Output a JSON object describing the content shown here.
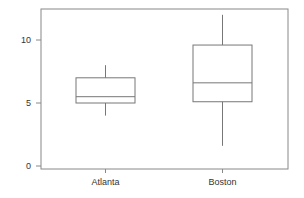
{
  "chart_data": {
    "type": "box",
    "title": "",
    "xlabel": "",
    "ylabel": "",
    "ylim": [
      -0.2,
      12.5
    ],
    "yticks": [
      0,
      5,
      10
    ],
    "ytick_labels": [
      "0",
      "5",
      "10"
    ],
    "categories": [
      "Atlanta",
      "Boston"
    ],
    "series": [
      {
        "name": "Atlanta",
        "whisker_low": 4.0,
        "q1": 5.0,
        "median": 5.5,
        "q3": 7.0,
        "whisker_high": 8.0
      },
      {
        "name": "Boston",
        "whisker_low": 1.6,
        "q1": 5.1,
        "median": 6.6,
        "q3": 9.6,
        "whisker_high": 12.0
      }
    ],
    "grid": false,
    "legend": null
  },
  "colors": {
    "frame": "#888888",
    "box": "#777777",
    "text": "#333333",
    "background": "#ffffff"
  }
}
